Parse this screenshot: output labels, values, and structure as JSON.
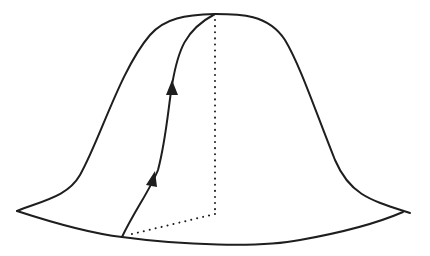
{
  "diagram": {
    "title": "",
    "colors": {
      "stroke": "#1e1e1e",
      "background": "#ffffff"
    },
    "elements": {
      "outer_left_profile": "left silhouette of the bell surface",
      "outer_right_profile": "right silhouette of the bell surface",
      "front_rim": "front edge of the base (near side)",
      "back_rim_right": "right back edge of the base",
      "surface_path": "curve on the surface from base point to peak",
      "arrows": [
        "arrow-upper",
        "arrow-lower"
      ],
      "vertical_axis": "dotted line from peak to base center",
      "base_radius": "dotted line from base center to rim point"
    },
    "labels": []
  }
}
